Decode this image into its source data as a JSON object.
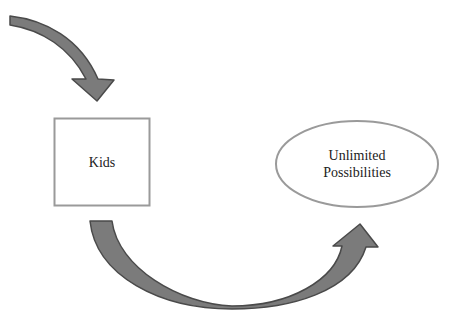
{
  "diagram": {
    "nodes": [
      {
        "id": "kids",
        "shape": "rectangle",
        "label": "Kids"
      },
      {
        "id": "unlimited",
        "shape": "ellipse",
        "label_lines": [
          "Unlimited",
          "Possibilities"
        ]
      }
    ],
    "arrows": [
      {
        "id": "incoming-arrow",
        "from": "off-canvas-top-left",
        "to": "kids",
        "style": "curved-block"
      },
      {
        "id": "u-arrow",
        "from": "kids",
        "to": "unlimited",
        "style": "curved-block-u-shape"
      }
    ],
    "colors": {
      "arrow_fill": "#7b7b7b",
      "arrow_stroke": "#4a4a4a",
      "node_stroke": "#9a9a9a",
      "background": "#ffffff",
      "text": "#222222"
    }
  }
}
